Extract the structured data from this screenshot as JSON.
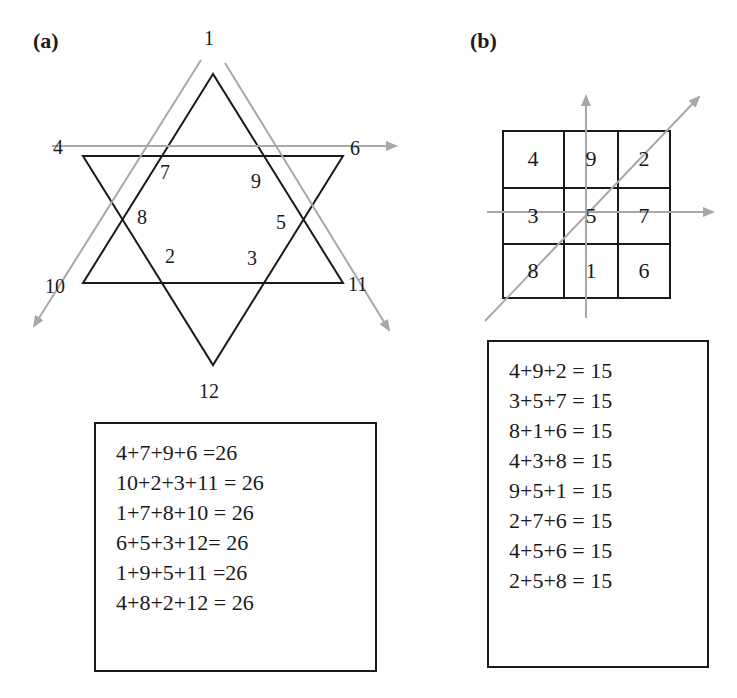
{
  "panel_a": {
    "label": "(a)",
    "vertex_labels": {
      "top": "1",
      "left_upper": "4",
      "right_upper": "6",
      "inner_7": "7",
      "inner_9": "9",
      "inner_8": "8",
      "inner_5": "5",
      "inner_2": "2",
      "inner_3": "3",
      "left_lower": "10",
      "right_lower": "11",
      "bottom": "12"
    },
    "equations": [
      "4+7+9+6 =26",
      "10+2+3+11 = 26",
      "1+7+8+10 = 26",
      "6+5+3+12= 26",
      "1+9+5+11 =26",
      "4+8+2+12 = 26"
    ]
  },
  "panel_b": {
    "label": "(b)",
    "grid": [
      [
        "4",
        "9",
        "2"
      ],
      [
        "3",
        "5",
        "7"
      ],
      [
        "8",
        "1",
        "6"
      ]
    ],
    "equations": [
      "4+9+2 = 15",
      "3+5+7 = 15",
      "8+1+6 = 15",
      "4+3+8 = 15",
      "9+5+1 = 15",
      "2+7+6 = 15",
      "4+5+6 = 15",
      "2+5+8 = 15"
    ]
  },
  "colors": {
    "line": "#1a1a1a",
    "arrow": "#a8a8a8"
  }
}
